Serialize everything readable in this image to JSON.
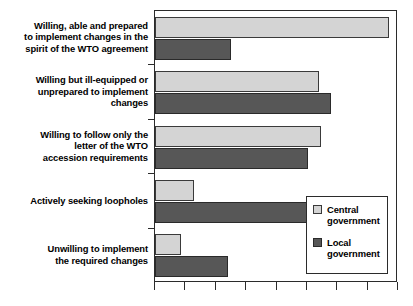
{
  "chart_data": {
    "type": "bar",
    "orientation": "horizontal",
    "title": "",
    "xlabel": "",
    "ylabel": "",
    "grid": false,
    "xlim": [
      0,
      8
    ],
    "xticks": [
      0,
      1,
      2,
      3,
      4,
      5,
      6,
      7,
      8
    ],
    "xtick_labels": [
      "",
      "",
      "",
      "",
      "",
      "",
      "",
      "",
      ""
    ],
    "legend_position": "bottom-right",
    "categories": [
      "Willing, able and prepared to implement changes in the spirit of the WTO agreement",
      "Willing but ill-equipped or unprepared to implement changes",
      "Willing to follow only the letter of the WTO accession requirements",
      "Actively seeking loopholes",
      "Unwilling to implement the required changes"
    ],
    "series": [
      {
        "name": "Central government",
        "color": "#d4d4d4",
        "values": [
          7.7,
          5.4,
          5.45,
          1.3,
          0.85
        ]
      },
      {
        "name": "Local government",
        "color": "#575757",
        "values": [
          2.5,
          5.8,
          5.05,
          5.2,
          2.4
        ]
      }
    ]
  },
  "legend": {
    "entries": [
      {
        "label_line1": "Central",
        "label_line2": "government",
        "swatch": "legend-swatch-central"
      },
      {
        "label_line1": "Local",
        "label_line2": "government",
        "swatch": "legend-swatch-local"
      }
    ]
  },
  "category_labels": [
    {
      "line1": "Willing, able and prepared",
      "line2": "to implement changes in the",
      "line3": "spirit of the WTO agreement"
    },
    {
      "line1": "Willing but ill-equipped or",
      "line2": "unprepared to implement",
      "line3": "changes"
    },
    {
      "line1": "Willing to follow only the",
      "line2": "letter of the WTO",
      "line3": "accession requirements"
    },
    {
      "line1": "Actively seeking loopholes",
      "line2": "",
      "line3": ""
    },
    {
      "line1": "Unwilling to implement",
      "line2": "the required changes",
      "line3": ""
    }
  ]
}
